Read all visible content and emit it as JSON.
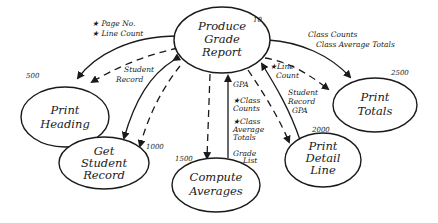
{
  "diagram": {
    "type": "structure-chart",
    "nodes": [
      {
        "id": "produce",
        "number": "10",
        "lines": [
          "Produce",
          "Grade",
          "Report"
        ]
      },
      {
        "id": "heading",
        "number": "500",
        "lines": [
          "Print",
          "Heading"
        ]
      },
      {
        "id": "getrec",
        "number": "1000",
        "lines": [
          "Get",
          "Student",
          "Record"
        ]
      },
      {
        "id": "compute",
        "number": "1500",
        "lines": [
          "Compute",
          "Averages"
        ]
      },
      {
        "id": "detail",
        "number": "2000",
        "lines": [
          "Print",
          "Detail",
          "Line"
        ]
      },
      {
        "id": "totals",
        "number": "2500",
        "lines": [
          "Print",
          "Totals"
        ]
      }
    ],
    "flows": {
      "heading_control": [
        "★ Page No.",
        "★ Line Count"
      ],
      "heading_data": [
        "Student",
        "Record"
      ],
      "compute_up_gpa": "GPA",
      "compute_control": [
        "★Class",
        "Counts",
        "★Class",
        "Average",
        "Totals"
      ],
      "compute_down": [
        "Grade",
        "List"
      ],
      "detail_control": [
        "★Line",
        "Count"
      ],
      "detail_data": [
        "Student",
        "Record",
        "GPA"
      ],
      "totals_data": [
        "Class Counts",
        "Class Average Totals"
      ]
    }
  }
}
